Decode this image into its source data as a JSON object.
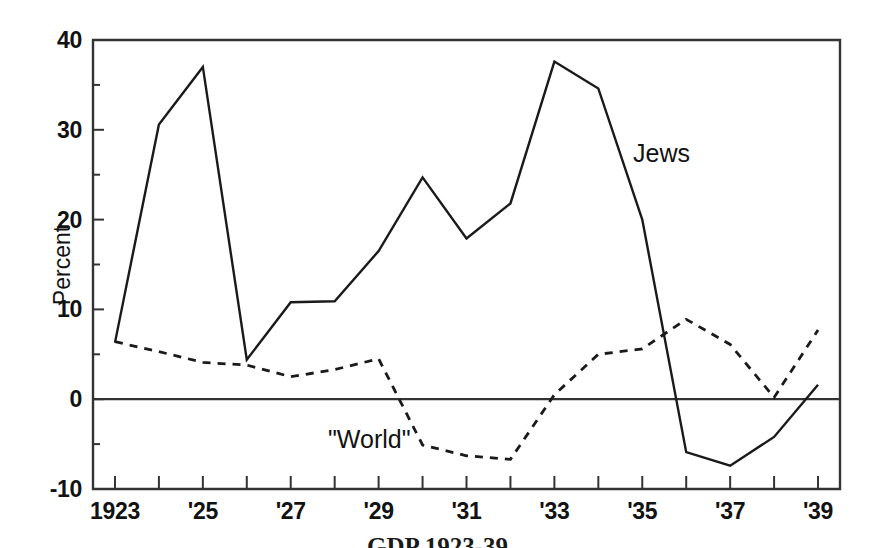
{
  "chart_data": {
    "type": "line",
    "title": "",
    "xlabel": "",
    "ylabel": "Percent",
    "xlim": [
      1922.5,
      1939.5
    ],
    "ylim": [
      -10,
      40
    ],
    "grid": false,
    "legend_position": "inline-annotation",
    "x": [
      1923,
      1924,
      1925,
      1926,
      1927,
      1928,
      1929,
      1930,
      1931,
      1932,
      1933,
      1934,
      1935,
      1936,
      1937,
      1938,
      1939
    ],
    "series": [
      {
        "name": "Jews",
        "style": "solid",
        "values": [
          6.3,
          30.6,
          37.0,
          4.4,
          10.8,
          10.9,
          16.5,
          24.7,
          17.9,
          21.8,
          37.6,
          34.6,
          20.0,
          -5.9,
          -7.4,
          -4.2,
          1.6
        ]
      },
      {
        "name": "\"World\"",
        "style": "dashed",
        "values": [
          6.4,
          5.3,
          4.1,
          3.8,
          2.5,
          3.3,
          4.5,
          -5.1,
          -6.3,
          -6.7,
          0.5,
          5.0,
          5.6,
          8.9,
          6.1,
          0.2,
          7.7
        ]
      }
    ],
    "x_ticks": [
      {
        "value": 1923,
        "label": "1923",
        "major": true
      },
      {
        "value": 1924,
        "label": "",
        "major": false
      },
      {
        "value": 1925,
        "label": "'25",
        "major": true
      },
      {
        "value": 1926,
        "label": "",
        "major": false
      },
      {
        "value": 1927,
        "label": "'27",
        "major": true
      },
      {
        "value": 1928,
        "label": "",
        "major": false
      },
      {
        "value": 1929,
        "label": "'29",
        "major": true
      },
      {
        "value": 1930,
        "label": "",
        "major": false
      },
      {
        "value": 1931,
        "label": "'31",
        "major": true
      },
      {
        "value": 1932,
        "label": "",
        "major": false
      },
      {
        "value": 1933,
        "label": "'33",
        "major": true
      },
      {
        "value": 1934,
        "label": "",
        "major": false
      },
      {
        "value": 1935,
        "label": "'35",
        "major": true
      },
      {
        "value": 1936,
        "label": "",
        "major": false
      },
      {
        "value": 1937,
        "label": "'37",
        "major": true
      },
      {
        "value": 1938,
        "label": "",
        "major": false
      },
      {
        "value": 1939,
        "label": "'39",
        "major": true
      }
    ],
    "y_ticks": [
      {
        "value": 40,
        "label": "40",
        "major": true
      },
      {
        "value": 35,
        "label": "",
        "major": false
      },
      {
        "value": 30,
        "label": "30",
        "major": true
      },
      {
        "value": 25,
        "label": "",
        "major": false
      },
      {
        "value": 20,
        "label": "20",
        "major": true
      },
      {
        "value": 15,
        "label": "",
        "major": false
      },
      {
        "value": 10,
        "label": "10",
        "major": true
      },
      {
        "value": 5,
        "label": "",
        "major": false
      },
      {
        "value": 0,
        "label": "0",
        "major": true
      },
      {
        "value": -5,
        "label": "",
        "major": false
      },
      {
        "value": -10,
        "label": "-10",
        "major": true
      }
    ],
    "annotations": [
      {
        "id": "jews",
        "text": "Jews"
      },
      {
        "id": "world",
        "text": "\"World\""
      }
    ],
    "zero_line": 0,
    "line_color": "#1a1a1a",
    "axis_color": "#333333"
  },
  "caption": {
    "text": "GDP 1923-39"
  }
}
